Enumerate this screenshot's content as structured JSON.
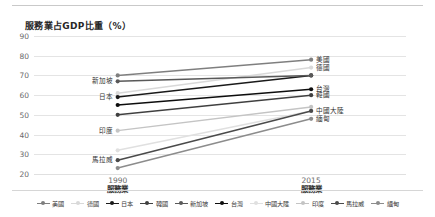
{
  "chart_data": {
    "type": "line",
    "title": "服務業占GDP比重（%）",
    "xlabel": "",
    "ylabel": "",
    "x": [
      "1990",
      "2015"
    ],
    "x_sub": [
      "服務業",
      "服務業"
    ],
    "ylim": [
      20,
      90
    ],
    "yticks": [
      90,
      80,
      70,
      60,
      50,
      40,
      30,
      20
    ],
    "grid": true,
    "legend_position": "bottom",
    "series": [
      {
        "name": "美國",
        "values": [
          70,
          78
        ],
        "color": "#7f7f7f",
        "label_left": "",
        "label_right": "美國"
      },
      {
        "name": "德國",
        "values": [
          61,
          74
        ],
        "color": "#d9d9d9",
        "label_left": "",
        "label_right": "德國"
      },
      {
        "name": "日本",
        "values": [
          59,
          70
        ],
        "color": "#1a1a1a",
        "label_left": "日本",
        "label_right": ""
      },
      {
        "name": "韓國",
        "values": [
          50,
          60
        ],
        "color": "#404040",
        "label_left": "",
        "label_right": "韓國"
      },
      {
        "name": "新加坡",
        "values": [
          67,
          70
        ],
        "color": "#595959",
        "label_left": "新加坡",
        "label_right": ""
      },
      {
        "name": "台灣",
        "values": [
          55,
          63
        ],
        "color": "#0d0d0d",
        "label_left": "",
        "label_right": "台灣"
      },
      {
        "name": "中國大陸",
        "values": [
          32,
          52
        ],
        "color": "#e0e0e0",
        "label_left": "",
        "label_right": "中國大陸"
      },
      {
        "name": "印度",
        "values": [
          42,
          54
        ],
        "color": "#c4c4c4",
        "label_left": "印度",
        "label_right": ""
      },
      {
        "name": "馬拉威",
        "values": [
          27,
          52
        ],
        "color": "#4a4a4a",
        "label_left": "馬拉威",
        "label_right": ""
      },
      {
        "name": "緬甸",
        "values": [
          23,
          48
        ],
        "color": "#8c8c8c",
        "label_left": "",
        "label_right": "緬甸"
      }
    ]
  },
  "legend": {
    "items": [
      "美國",
      "德國",
      "日本",
      "韓國",
      "新加坡",
      "台灣",
      "中國大陸",
      "印度",
      "馬拉威",
      "緬甸"
    ]
  }
}
